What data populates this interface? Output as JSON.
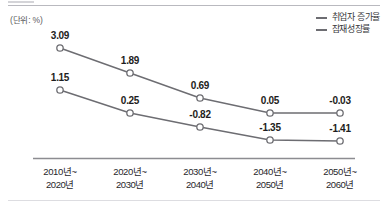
{
  "unit_label": "(단위: %)",
  "legend": {
    "items": [
      {
        "label": "취업자 증가율",
        "color": "#6d6d72",
        "swatch": "line-swatch-icon"
      },
      {
        "label": "잠재성장률",
        "color": "#6d6d72",
        "swatch": "line-swatch-icon"
      }
    ]
  },
  "axis": {
    "line_color": "#8c8c91"
  },
  "chart_data": {
    "type": "line",
    "title": "",
    "subtitle": "",
    "xlabel": "",
    "ylabel": "",
    "unit": "%",
    "grid": false,
    "legend_position": "top-right",
    "categories": [
      "2010년~\n2020년",
      "2020년~\n2030년",
      "2030년~\n2040년",
      "2040년~\n2050년",
      "2050년~\n2060년"
    ],
    "category_lines": [
      [
        "2010년~",
        "2020년"
      ],
      [
        "2020년~",
        "2030년"
      ],
      [
        "2030년~",
        "2040년"
      ],
      [
        "2040년~",
        "2050년"
      ],
      [
        "2050년~",
        "2060년"
      ]
    ],
    "series": [
      {
        "name": "취업자 증가율",
        "color": "#6d6d72",
        "marker": "open-circle",
        "values": [
          3.09,
          1.89,
          0.69,
          0.05,
          -0.03
        ],
        "labels": [
          "3.09",
          "1.89",
          "0.69",
          "0.05",
          "-0.03"
        ]
      },
      {
        "name": "잠재성장률",
        "color": "#6d6d72",
        "marker": "open-circle",
        "values": [
          1.15,
          0.25,
          -0.82,
          -1.35,
          -1.41
        ],
        "labels": [
          "1.15",
          "0.25",
          "-0.82",
          "-1.35",
          "-1.41"
        ]
      }
    ],
    "ylim": [
      -2.0,
      3.6
    ]
  },
  "points": {
    "top": [
      {
        "x": 60,
        "y": 48,
        "label": "3.09",
        "lx": 60,
        "ly": 30
      },
      {
        "x": 130,
        "y": 73,
        "label": "1.89",
        "lx": 130,
        "ly": 55
      },
      {
        "x": 200,
        "y": 98,
        "label": "0.69",
        "lx": 200,
        "ly": 80
      },
      {
        "x": 270,
        "y": 113,
        "label": "0.05",
        "lx": 270,
        "ly": 95
      },
      {
        "x": 340,
        "y": 113,
        "label": "-0.03",
        "lx": 340,
        "ly": 95
      }
    ],
    "bottom": [
      {
        "x": 60,
        "y": 90,
        "label": "1.15",
        "lx": 60,
        "ly": 72
      },
      {
        "x": 130,
        "y": 113,
        "label": "0.25",
        "lx": 130,
        "ly": 95
      },
      {
        "x": 200,
        "y": 127,
        "label": "-0.82",
        "lx": 200,
        "ly": 109
      },
      {
        "x": 270,
        "y": 140,
        "label": "-1.35",
        "lx": 270,
        "ly": 122
      },
      {
        "x": 340,
        "y": 141,
        "label": "-1.41",
        "lx": 340,
        "ly": 123
      }
    ]
  }
}
